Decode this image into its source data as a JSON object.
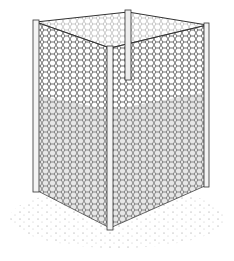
{
  "illustration": {
    "subject": "wire-mesh compost bin",
    "colors": {
      "ink": "#3a3a3a",
      "background": "#ffffff",
      "fill": "#e4e4e4",
      "post": "#f2f2f2"
    },
    "corners": {
      "left_top": [
        36,
        22
      ],
      "back_top": [
        128,
        12
      ],
      "right_top": [
        207,
        25
      ],
      "front_top": [
        110,
        48
      ],
      "left_bottom": [
        36,
        190
      ],
      "front_bottom": [
        110,
        228
      ],
      "right_bottom": [
        207,
        185
      ]
    }
  }
}
